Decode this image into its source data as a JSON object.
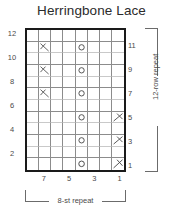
{
  "chart_title": "Herringbone Lace",
  "chart_data": {
    "type": "table",
    "title": "Herringbone Lace",
    "columns": 8,
    "rows": 12,
    "row_labels_left": [
      "12",
      "10",
      "8",
      "6",
      "4",
      "2"
    ],
    "row_labels_right": [
      "11",
      "9",
      "7",
      "5",
      "3",
      "1"
    ],
    "column_labels": [
      "7",
      "5",
      "3",
      "1"
    ],
    "column_label_stitches": [
      7,
      5,
      3,
      1
    ],
    "symbol_legend": {
      "yo": "yarn-over-circle",
      "ssk": "left-leaning-decrease",
      "k2tog": "right-leaning-decrease",
      "blank": "knit-plain"
    },
    "cells": [
      {
        "row": 12,
        "col": 7,
        "symbol": "blank"
      },
      {
        "row": 11,
        "col": 7,
        "symbol": "ssk"
      },
      {
        "row": 11,
        "col": 4,
        "symbol": "yo"
      },
      {
        "row": 10,
        "col": 7,
        "symbol": "blank"
      },
      {
        "row": 9,
        "col": 7,
        "symbol": "ssk"
      },
      {
        "row": 9,
        "col": 4,
        "symbol": "yo"
      },
      {
        "row": 8,
        "col": 7,
        "symbol": "blank"
      },
      {
        "row": 7,
        "col": 7,
        "symbol": "ssk"
      },
      {
        "row": 7,
        "col": 4,
        "symbol": "yo"
      },
      {
        "row": 6,
        "col": 1,
        "symbol": "blank"
      },
      {
        "row": 5,
        "col": 1,
        "symbol": "k2tog"
      },
      {
        "row": 5,
        "col": 4,
        "symbol": "yo"
      },
      {
        "row": 4,
        "col": 1,
        "symbol": "blank"
      },
      {
        "row": 3,
        "col": 1,
        "symbol": "k2tog"
      },
      {
        "row": 3,
        "col": 4,
        "symbol": "yo"
      },
      {
        "row": 2,
        "col": 1,
        "symbol": "blank"
      },
      {
        "row": 1,
        "col": 1,
        "symbol": "k2tog"
      },
      {
        "row": 1,
        "col": 4,
        "symbol": "yo"
      }
    ],
    "grid_rows_top_to_bottom": [
      {
        "row": 12,
        "symbols": [
          "",
          "",
          "",
          "",
          "",
          "",
          "",
          ""
        ]
      },
      {
        "row": 11,
        "symbols": [
          "",
          "ssk",
          "",
          "",
          "yo",
          "",
          "",
          ""
        ]
      },
      {
        "row": 10,
        "symbols": [
          "",
          "",
          "",
          "",
          "",
          "",
          "",
          ""
        ]
      },
      {
        "row": 9,
        "symbols": [
          "",
          "ssk",
          "",
          "",
          "yo",
          "",
          "",
          ""
        ]
      },
      {
        "row": 8,
        "symbols": [
          "",
          "",
          "",
          "",
          "",
          "",
          "",
          ""
        ]
      },
      {
        "row": 7,
        "symbols": [
          "",
          "ssk",
          "",
          "",
          "yo",
          "",
          "",
          ""
        ]
      },
      {
        "row": 6,
        "symbols": [
          "",
          "",
          "",
          "",
          "",
          "",
          "",
          ""
        ]
      },
      {
        "row": 5,
        "symbols": [
          "",
          "",
          "",
          "",
          "yo",
          "",
          "",
          "k2tog"
        ]
      },
      {
        "row": 4,
        "symbols": [
          "",
          "",
          "",
          "",
          "",
          "",
          "",
          ""
        ]
      },
      {
        "row": 3,
        "symbols": [
          "",
          "",
          "",
          "",
          "yo",
          "",
          "",
          "k2tog"
        ]
      },
      {
        "row": 2,
        "symbols": [
          "",
          "",
          "",
          "",
          "",
          "",
          "",
          ""
        ]
      },
      {
        "row": 1,
        "symbols": [
          "",
          "",
          "",
          "",
          "yo",
          "",
          "",
          "k2tog"
        ]
      }
    ],
    "grid_on": true,
    "border_color": "#1a1a1a",
    "gridline_color": "#8c8c8c",
    "symbol_color": "#4a4a4a"
  },
  "repeats": {
    "vertical_label": "12-row repeat",
    "horizontal_label": "8-st repeat"
  }
}
